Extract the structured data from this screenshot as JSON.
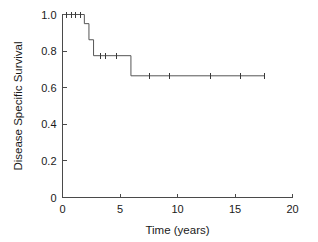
{
  "chart_data": {
    "type": "line",
    "subtype": "kaplan-meier-survival-curve",
    "title": "",
    "xlabel": "Time (years)",
    "ylabel": "Disease Specific Survival",
    "xlim": [
      0,
      20
    ],
    "ylim": [
      0,
      1.0
    ],
    "xticks": [
      0,
      5,
      10,
      15,
      20
    ],
    "xtick_labels": [
      "0",
      "5",
      "10",
      "15",
      "20"
    ],
    "yticks": [
      0,
      0.2,
      0.4,
      0.6,
      0.8,
      1.0
    ],
    "ytick_labels": [
      "0",
      "0.2",
      "0.4",
      "0.6",
      "0.8",
      "1.0"
    ],
    "grid": false,
    "legend": null,
    "series": [
      {
        "name": "Disease Specific Survival",
        "color": "#555555",
        "step_points": [
          {
            "x": 0.0,
            "y": 1.0
          },
          {
            "x": 1.9,
            "y": 1.0
          },
          {
            "x": 1.9,
            "y": 0.95
          },
          {
            "x": 2.3,
            "y": 0.95
          },
          {
            "x": 2.3,
            "y": 0.862
          },
          {
            "x": 2.7,
            "y": 0.862
          },
          {
            "x": 2.7,
            "y": 0.775
          },
          {
            "x": 5.95,
            "y": 0.775
          },
          {
            "x": 5.95,
            "y": 0.665
          },
          {
            "x": 17.6,
            "y": 0.665
          }
        ],
        "censored": [
          {
            "x": 0.35,
            "y": 1.0
          },
          {
            "x": 0.75,
            "y": 1.0
          },
          {
            "x": 1.15,
            "y": 1.0
          },
          {
            "x": 1.55,
            "y": 1.0
          },
          {
            "x": 3.3,
            "y": 0.775
          },
          {
            "x": 3.75,
            "y": 0.775
          },
          {
            "x": 4.7,
            "y": 0.775
          },
          {
            "x": 7.6,
            "y": 0.665
          },
          {
            "x": 9.3,
            "y": 0.665
          },
          {
            "x": 12.9,
            "y": 0.665
          },
          {
            "x": 15.5,
            "y": 0.665
          },
          {
            "x": 17.55,
            "y": 0.665
          }
        ]
      }
    ]
  },
  "colors": {
    "curve": "#555555",
    "axis": "#4a4a4a",
    "text": "#1a1a1a",
    "background": "#ffffff"
  }
}
